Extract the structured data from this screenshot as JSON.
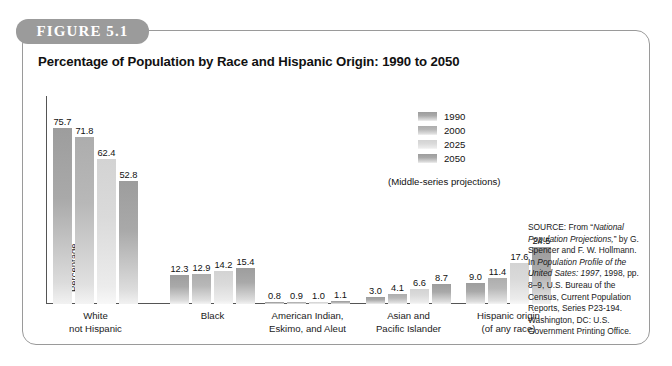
{
  "figure": {
    "tab_label": "FIGURE 5.1",
    "title": "Percentage of Population by Race and Hispanic Origin: 1990 to 2050"
  },
  "legend": {
    "note": "(Middle-series projections)",
    "items": [
      {
        "label": "1990",
        "color": "#a4a4a4"
      },
      {
        "label": "2000",
        "color": "#b4b4b4"
      },
      {
        "label": "2025",
        "color": "#d6d6d6"
      },
      {
        "label": "2050",
        "color": "#a4a4a4"
      }
    ]
  },
  "source": {
    "prefix": "SOURCE: From “",
    "title_italic": "National Population Projections,",
    "mid1": "” by G. Spencer and F. W. Hollmann. In ",
    "title_italic2": "Population Profile of the United Sates: 1997",
    "rest": ", 1998, pp. 8–9, U.S. Bureau of the Census, Current Population Reports, Series P23-194. Washington, DC: U.S. Government Printing Office."
  },
  "chart_data": {
    "type": "bar",
    "title": "Percentage of Population by Race and Hispanic Origin: 1990 to 2050",
    "xlabel": "",
    "ylabel": "Percentage",
    "ylim": [
      0,
      80
    ],
    "grid": false,
    "legend_position": "upper-right",
    "categories": [
      "White\nnot Hispanic",
      "Black",
      "American Indian,\nEskimo, and Aleut",
      "Asian and\nPacific Islander",
      "Hispanic origin\n(of any race)"
    ],
    "category_lines": [
      [
        "White",
        "not Hispanic"
      ],
      [
        "Black"
      ],
      [
        "American Indian,",
        "Eskimo, and Aleut"
      ],
      [
        "Asian and",
        "Pacific Islander"
      ],
      [
        "Hispanic origin",
        "(of any race)"
      ]
    ],
    "series": [
      {
        "name": "1990",
        "values": [
          75.7,
          12.3,
          0.8,
          3.0,
          9.0
        ]
      },
      {
        "name": "2000",
        "values": [
          71.8,
          12.9,
          0.9,
          4.1,
          11.4
        ]
      },
      {
        "name": "2025",
        "values": [
          62.4,
          14.2,
          1.0,
          6.6,
          17.6
        ]
      },
      {
        "name": "2050",
        "values": [
          52.8,
          15.4,
          1.1,
          8.7,
          24.5
        ]
      }
    ],
    "annotation": "(Middle-series projections)"
  }
}
